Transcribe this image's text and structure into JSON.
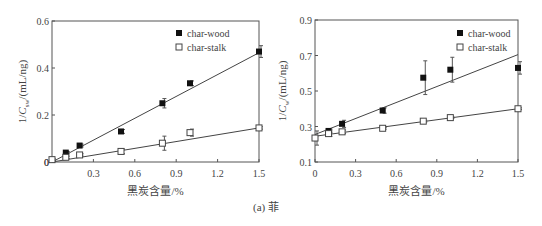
{
  "figure": {
    "caption": "(a) 菲"
  },
  "chart_data": [
    {
      "type": "scatter",
      "title": "",
      "xlabel": "黑炭含量/%",
      "ylabel": "1/C_sw/(mL/ng)",
      "ylabel_main": "1/C",
      "ylabel_sub": "sw",
      "ylabel_tail": "/(mL/ng)",
      "xlim": [
        0,
        1.5
      ],
      "ylim": [
        0,
        0.6
      ],
      "xticks": [
        0.3,
        0.6,
        0.9,
        1.2,
        1.5
      ],
      "xtick_labels": [
        "0.3",
        "0.6",
        "0.9",
        "1.2",
        "1.5"
      ],
      "yticks": [
        0,
        0.2,
        0.4,
        0.6
      ],
      "ytick_labels": [
        "0",
        "0.2",
        "0.4",
        "0.6"
      ],
      "origin_label": "0",
      "grid": false,
      "legend_position": "upper-left-inside (top right area)",
      "series": [
        {
          "name": "char-wood",
          "marker": "filled-square",
          "x": [
            0.1,
            0.2,
            0.5,
            0.8,
            1.0,
            1.5
          ],
          "y": [
            0.04,
            0.07,
            0.13,
            0.25,
            0.335,
            0.47
          ],
          "err": [
            0.005,
            0.006,
            0.008,
            0.02,
            0.01,
            0.025
          ],
          "fit_line": {
            "x0": 0,
            "y0": 0.0,
            "x1": 1.5,
            "y1": 0.465
          }
        },
        {
          "name": "char-stalk",
          "marker": "open-square",
          "x": [
            0.0,
            0.1,
            0.2,
            0.5,
            0.8,
            1.0,
            1.5
          ],
          "y": [
            0.01,
            0.02,
            0.03,
            0.045,
            0.08,
            0.125,
            0.145
          ],
          "err": [
            0.003,
            0.005,
            0.005,
            0.01,
            0.03,
            0.015,
            0.005
          ],
          "fit_line": {
            "x0": 0,
            "y0": 0.0,
            "x1": 1.5,
            "y1": 0.145
          }
        }
      ]
    },
    {
      "type": "scatter",
      "title": "",
      "xlabel": "黑炭含量/%",
      "ylabel": "1/C_w/(mL/ng)",
      "ylabel_main": "1/C",
      "ylabel_sub": "w",
      "ylabel_tail": "/(mL/ng)",
      "xlim": [
        0,
        1.5
      ],
      "ylim": [
        0.1,
        0.9
      ],
      "xticks": [
        0,
        0.3,
        0.6,
        0.9,
        1.2,
        1.5
      ],
      "xtick_labels": [
        "0",
        "0.3",
        "0.6",
        "0.9",
        "1.2",
        "1.5"
      ],
      "yticks": [
        0.1,
        0.3,
        0.5,
        0.7,
        0.9
      ],
      "ytick_labels": [
        "0.1",
        "0.3",
        "0.5",
        "0.7",
        "0.9"
      ],
      "grid": false,
      "legend_position": "top right inside",
      "series": [
        {
          "name": "char-wood",
          "marker": "filled-square",
          "x": [
            0.1,
            0.2,
            0.5,
            0.8,
            1.0,
            1.5
          ],
          "y": [
            0.275,
            0.315,
            0.39,
            0.575,
            0.62,
            0.63
          ],
          "err": [
            0.01,
            0.02,
            0.015,
            0.095,
            0.07,
            0.035
          ],
          "fit_line": {
            "x0": 0,
            "y0": 0.255,
            "x1": 1.5,
            "y1": 0.705
          }
        },
        {
          "name": "char-stalk",
          "marker": "open-square",
          "x": [
            0.0,
            0.1,
            0.2,
            0.5,
            0.8,
            1.0,
            1.5
          ],
          "y": [
            0.235,
            0.26,
            0.27,
            0.29,
            0.33,
            0.35,
            0.4
          ],
          "err": [
            0.04,
            0.015,
            0.01,
            0.005,
            0.005,
            0.005,
            0.005
          ],
          "fit_line": {
            "x0": 0,
            "y0": 0.245,
            "x1": 1.5,
            "y1": 0.4
          }
        }
      ]
    }
  ]
}
